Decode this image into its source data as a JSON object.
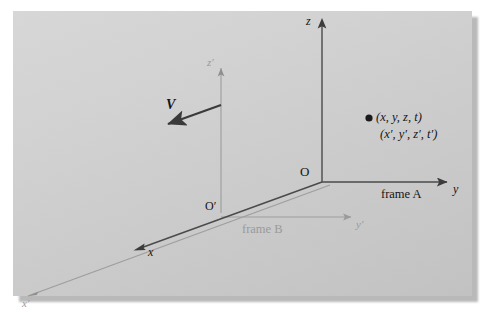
{
  "figure": {
    "kind": "coordinate-frames-diagram",
    "panel": {
      "background_light": "#d7d7d7",
      "background_dark": "#c2c2c2",
      "shadow_color": "#b9b9b9"
    },
    "colors": {
      "frame_a_axis": "#4a4a4a",
      "frame_b_axis": "#9a9a9a",
      "velocity_arrow": "#3a3a3a",
      "label_text": "#141414",
      "faint_text": "#9a9a9a",
      "point_marker": "#1a1a1a"
    }
  },
  "frame_a": {
    "name": "frame A",
    "origin_label": "O",
    "axes": [
      {
        "id": "z-axis",
        "label": "z"
      },
      {
        "id": "y-axis",
        "label": "y"
      },
      {
        "id": "x-axis",
        "label": "x"
      }
    ]
  },
  "frame_b": {
    "name": "frame B",
    "origin_label": "O′",
    "axes": [
      {
        "id": "z-prime-axis",
        "label": "z′"
      },
      {
        "id": "y-prime-axis",
        "label": "y′"
      },
      {
        "id": "x-prime-axis",
        "label": "x′"
      }
    ]
  },
  "velocity": {
    "label": "V",
    "direction": "left-and-down"
  },
  "event_point": {
    "marker": "●",
    "coords_frame_a": "(x, y, z, t)",
    "coords_frame_b": "(x′, y′, z′, t′)"
  }
}
